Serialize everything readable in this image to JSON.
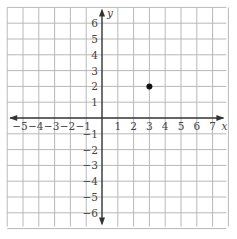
{
  "chart_data": {
    "type": "scatter",
    "title": "",
    "xlabel": "x",
    "ylabel": "y",
    "xlim": [
      -6,
      8
    ],
    "ylim": [
      -7,
      7
    ],
    "grid": true,
    "x_ticks": [
      "−5",
      "−4",
      "−3",
      "−2",
      "−1",
      "1",
      "2",
      "3",
      "4",
      "5",
      "6",
      "7"
    ],
    "x_tick_values": [
      -5,
      -4,
      -3,
      -2,
      -1,
      1,
      2,
      3,
      4,
      5,
      6,
      7
    ],
    "y_ticks": [
      "6",
      "5",
      "4",
      "3",
      "2",
      "1",
      "−1",
      "−2",
      "−3",
      "−4",
      "−5",
      "−6"
    ],
    "y_tick_values": [
      6,
      5,
      4,
      3,
      2,
      1,
      -1,
      -2,
      -3,
      -4,
      -5,
      -6
    ],
    "points": [
      {
        "x": 3,
        "y": 2
      }
    ],
    "colors": {
      "grid": "#b8b8b8",
      "axis": "#333333",
      "point": "#111111",
      "label": "#444444"
    }
  }
}
